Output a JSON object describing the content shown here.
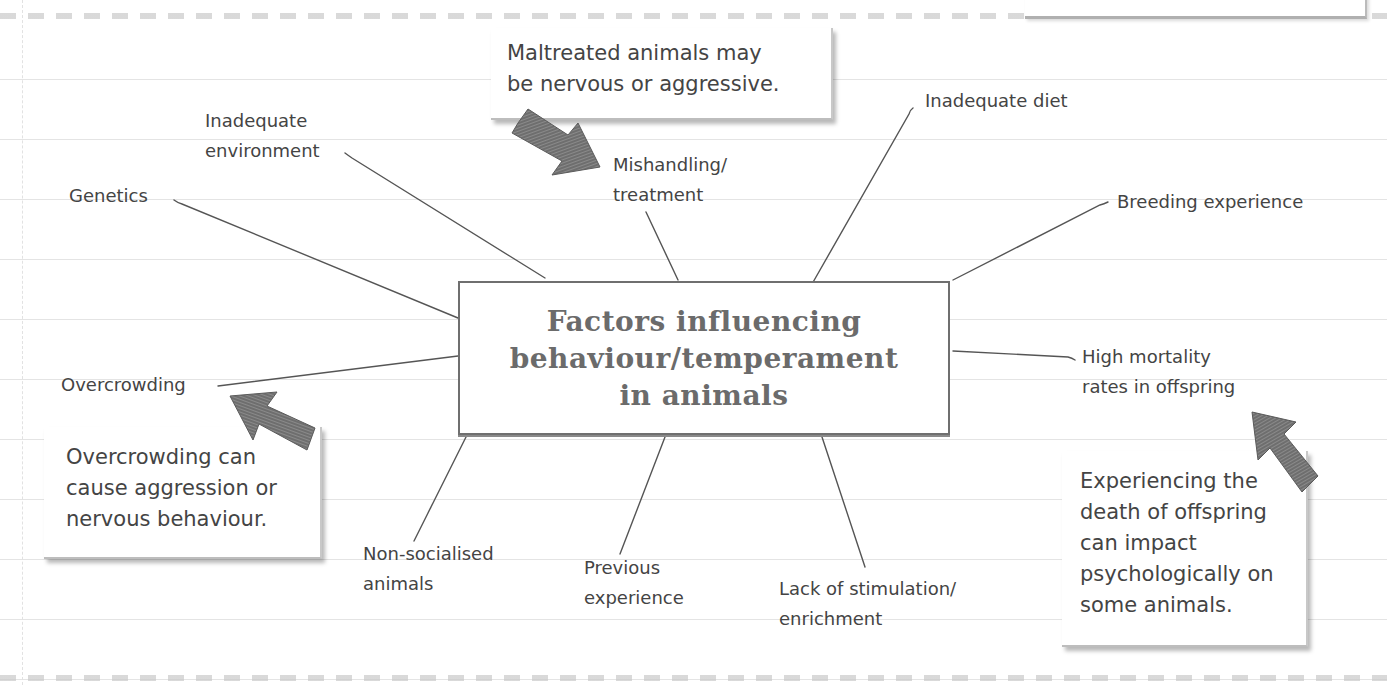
{
  "diagram": {
    "title_lines": [
      "Factors influencing",
      "behaviour/temperament",
      "in animals"
    ],
    "factors": {
      "genetics": [
        "Genetics"
      ],
      "inadequate_environment": [
        "Inadequate",
        "environment"
      ],
      "mishandling": [
        "Mishandling/",
        "treatment"
      ],
      "inadequate_diet": [
        "Inadequate diet"
      ],
      "breeding_experience": [
        "Breeding experience"
      ],
      "overcrowding": [
        "Overcrowding"
      ],
      "high_mortality": [
        "High mortality",
        "rates in offspring"
      ],
      "non_socialised": [
        "Non-socialised",
        "animals"
      ],
      "previous_experience": [
        "Previous",
        "experience"
      ],
      "lack_of_stimulation": [
        "Lack of stimulation/",
        "enrichment"
      ]
    },
    "notes": {
      "maltreated": [
        "Maltreated animals may",
        "be nervous or aggressive."
      ],
      "overcrowding": [
        "Overcrowding can",
        "cause aggression or",
        "nervous behaviour."
      ],
      "offspring": [
        "Experiencing the",
        "death of offspring",
        "can impact",
        "psychologically on",
        "some animals."
      ]
    },
    "colors": {
      "text": "#444444",
      "title": "#6b6b6b",
      "arrow": "#6e6e6e",
      "line": "#555555"
    }
  }
}
